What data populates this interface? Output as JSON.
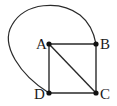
{
  "diagram": {
    "type": "graph",
    "vertices": [
      {
        "id": "A",
        "label": "A",
        "x": 49,
        "y": 44
      },
      {
        "id": "B",
        "label": "B",
        "x": 96,
        "y": 44
      },
      {
        "id": "C",
        "label": "C",
        "x": 96,
        "y": 93
      },
      {
        "id": "D",
        "label": "D",
        "x": 49,
        "y": 93
      }
    ],
    "edges": [
      {
        "from": "A",
        "to": "B",
        "style": "straight"
      },
      {
        "from": "B",
        "to": "C",
        "style": "straight"
      },
      {
        "from": "C",
        "to": "D",
        "style": "straight"
      },
      {
        "from": "D",
        "to": "A",
        "style": "straight"
      },
      {
        "from": "A",
        "to": "C",
        "style": "straight"
      },
      {
        "from": "D",
        "to": "B",
        "style": "curved"
      }
    ],
    "colors": {
      "line": "#2a2a2a",
      "vertex": "#111111",
      "background": "#ffffff"
    }
  }
}
